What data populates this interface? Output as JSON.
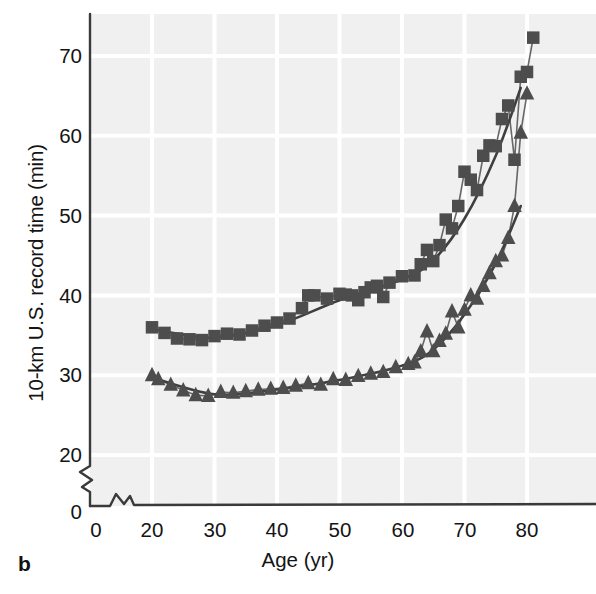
{
  "panel": {
    "label": "b"
  },
  "axes": {
    "ylabel": "10-km U.S. record time (min)",
    "xlabel": "Age (yr)",
    "yticks": [
      "0",
      "20",
      "30",
      "40",
      "50",
      "60",
      "70"
    ],
    "xticks": [
      "0",
      "20",
      "30",
      "40",
      "50",
      "60",
      "70",
      "80"
    ],
    "y_axis_break": true,
    "x_axis_break": true
  },
  "colors": {
    "plot_background": "#f0f0f0",
    "gridline": "#ffffff",
    "axis_line": "#3a3a3a",
    "marker": "#4d4d4d",
    "text": "#141414"
  },
  "chart_data": {
    "type": "scatter",
    "title": "",
    "xlabel": "Age (yr)",
    "ylabel": "10-km U.S. record time (min)",
    "xlim": [
      18,
      84
    ],
    "ylim": [
      20,
      74
    ],
    "grid": true,
    "legend": null,
    "series": [
      {
        "name": "Men (squares)",
        "marker": "square",
        "points": [
          [
            20,
            36.0
          ],
          [
            22,
            35.3
          ],
          [
            24,
            34.6
          ],
          [
            26,
            34.5
          ],
          [
            28,
            34.4
          ],
          [
            30,
            34.9
          ],
          [
            32,
            35.2
          ],
          [
            34,
            35.1
          ],
          [
            36,
            35.6
          ],
          [
            38,
            36.2
          ],
          [
            40,
            36.6
          ],
          [
            42,
            37.1
          ],
          [
            44,
            38.4
          ],
          [
            45,
            40.0
          ],
          [
            46,
            40.0
          ],
          [
            48,
            39.6
          ],
          [
            50,
            40.2
          ],
          [
            51,
            40.1
          ],
          [
            52,
            40.0
          ],
          [
            53,
            39.4
          ],
          [
            54,
            40.4
          ],
          [
            55,
            41.0
          ],
          [
            56,
            41.2
          ],
          [
            57,
            39.8
          ],
          [
            58,
            41.6
          ],
          [
            60,
            42.4
          ],
          [
            62,
            42.5
          ],
          [
            63,
            43.9
          ],
          [
            64,
            45.7
          ],
          [
            65,
            44.3
          ],
          [
            66,
            46.3
          ],
          [
            67,
            49.5
          ],
          [
            68,
            48.4
          ],
          [
            69,
            51.2
          ],
          [
            70,
            55.5
          ],
          [
            71,
            54.5
          ],
          [
            72,
            53.2
          ],
          [
            73,
            57.5
          ],
          [
            74,
            58.8
          ],
          [
            75,
            58.7
          ],
          [
            76,
            62.1
          ],
          [
            77,
            63.8
          ],
          [
            78,
            57.0
          ],
          [
            79,
            67.4
          ],
          [
            80,
            68.0
          ],
          [
            81,
            72.3
          ]
        ],
        "trend": [
          [
            20,
            35.8
          ],
          [
            30,
            34.7
          ],
          [
            40,
            36.3
          ],
          [
            50,
            39.4
          ],
          [
            60,
            42.0
          ],
          [
            65,
            44.4
          ],
          [
            70,
            49.6
          ],
          [
            75,
            57.5
          ],
          [
            79,
            66.0
          ]
        ]
      },
      {
        "name": "Women (triangles)",
        "marker": "triangle",
        "points": [
          [
            20,
            30.0
          ],
          [
            21,
            29.5
          ],
          [
            23,
            28.8
          ],
          [
            25,
            28.1
          ],
          [
            27,
            27.5
          ],
          [
            29,
            27.4
          ],
          [
            31,
            27.9
          ],
          [
            33,
            27.8
          ],
          [
            35,
            28.0
          ],
          [
            37,
            28.2
          ],
          [
            39,
            28.3
          ],
          [
            41,
            28.4
          ],
          [
            43,
            28.7
          ],
          [
            45,
            29.0
          ],
          [
            47,
            28.8
          ],
          [
            49,
            29.5
          ],
          [
            51,
            29.4
          ],
          [
            53,
            29.9
          ],
          [
            55,
            30.2
          ],
          [
            57,
            30.4
          ],
          [
            59,
            31.0
          ],
          [
            61,
            31.4
          ],
          [
            62,
            31.6
          ],
          [
            63,
            33.0
          ],
          [
            64,
            35.5
          ],
          [
            65,
            33.0
          ],
          [
            66,
            34.3
          ],
          [
            67,
            35.2
          ],
          [
            68,
            38.0
          ],
          [
            69,
            36.0
          ],
          [
            70,
            38.2
          ],
          [
            71,
            40.0
          ],
          [
            72,
            39.6
          ],
          [
            73,
            41.2
          ],
          [
            74,
            42.8
          ],
          [
            75,
            44.3
          ],
          [
            76,
            45.0
          ],
          [
            77,
            47.2
          ],
          [
            78,
            51.2
          ],
          [
            79,
            60.4
          ],
          [
            80,
            65.3
          ]
        ],
        "trend": [
          [
            20,
            29.7
          ],
          [
            30,
            27.6
          ],
          [
            40,
            28.2
          ],
          [
            50,
            29.4
          ],
          [
            60,
            31.2
          ],
          [
            65,
            33.2
          ],
          [
            70,
            37.6
          ],
          [
            75,
            44.0
          ],
          [
            79,
            51.2
          ]
        ]
      }
    ]
  }
}
